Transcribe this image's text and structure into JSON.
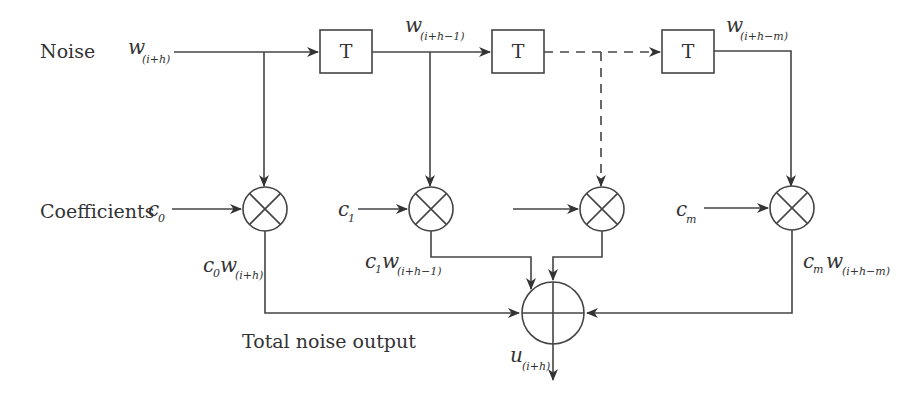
{
  "diagram": {
    "type": "block-diagram",
    "labels": {
      "noise": "Noise",
      "coefficients": "Coefficients",
      "total_output": "Total noise output"
    },
    "input": {
      "var": "w",
      "sub": "(i+h)"
    },
    "delay_blocks": [
      {
        "label": "T",
        "output_var": "w",
        "output_sub": "(i+h−1)"
      },
      {
        "label": "T"
      },
      {
        "label": "T",
        "output_var": "w",
        "output_sub": "(i+h−m)"
      }
    ],
    "coefficient_inputs": [
      {
        "var": "c",
        "sub": "0"
      },
      {
        "var": "c",
        "sub": "1"
      },
      {
        "var": "",
        "sub": ""
      },
      {
        "var": "c",
        "sub": "m"
      }
    ],
    "products": [
      {
        "c_var": "c",
        "c_sub": "0",
        "w_var": "w",
        "w_sub": "(i+h)"
      },
      {
        "c_var": "c",
        "c_sub": "1",
        "w_var": "w",
        "w_sub": "(i+h−1)"
      },
      {
        "c_var": "c",
        "c_sub": "m",
        "w_var": "w",
        "w_sub": "(i+h−m)"
      }
    ],
    "multiplier_symbol": "⊗",
    "adder_symbol": "⊕",
    "output": {
      "var": "u",
      "sub": "(i+h)"
    },
    "colors": {
      "stroke": "#444444",
      "text": "#333333",
      "background": "#ffffff"
    }
  }
}
